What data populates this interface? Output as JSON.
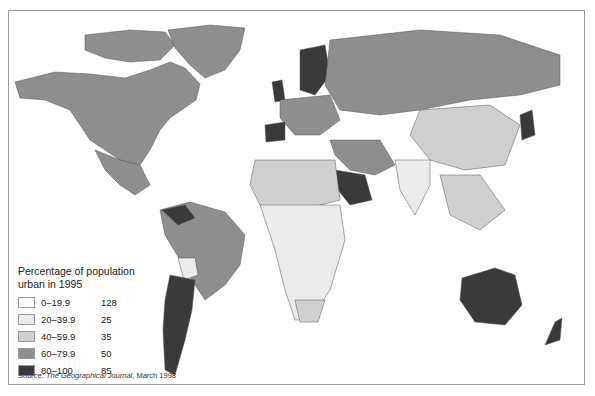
{
  "map": {
    "title": "Percentage of population urban in 1995",
    "title_line1": "Percentage of population",
    "title_line2": "urban in 1995",
    "legend": [
      {
        "range": "0–19.9",
        "count": "128",
        "color": "#ffffff"
      },
      {
        "range": "20–39.9",
        "count": "25",
        "color": "#ebebeb"
      },
      {
        "range": "40–59.9",
        "count": "35",
        "color": "#cfcfcf"
      },
      {
        "range": "60–79.9",
        "count": "50",
        "color": "#8e8e8e"
      },
      {
        "range": "80–100",
        "count": "85",
        "color": "#3a3a3a"
      }
    ],
    "source_prefix": "Source: ",
    "source_title": "The Geographical Journal",
    "source_suffix": ", March 1998"
  }
}
